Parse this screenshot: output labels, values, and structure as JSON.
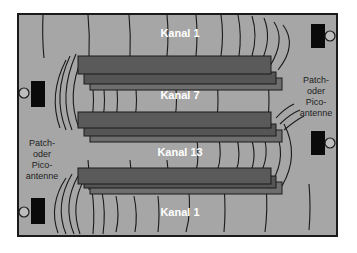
{
  "diagram": {
    "colors": {
      "room_fill": "#a6a6a6",
      "frame": "#1a1a1a",
      "shelf_top": "#5a5a5a",
      "shelf_mid": "#4d4d4d",
      "shelf_back": "#6e6e6e",
      "wave": "#1a1a1a",
      "antenna": "#0a0a0a",
      "channel_text": "#ffffff",
      "antenna_text": "#222222"
    },
    "channels": [
      {
        "label": "Kanal 1"
      },
      {
        "label": "Kanal 7"
      },
      {
        "label": "Kanal 13"
      },
      {
        "label": "Kanal 1"
      }
    ],
    "antenna_label_left": [
      "Patch-",
      "oder",
      "Pico-",
      "antenne"
    ],
    "antenna_label_right": [
      "Patch-",
      "oder",
      "Pico-",
      "antenne"
    ],
    "antennas": [
      {
        "position": "top-right"
      },
      {
        "position": "left-upper"
      },
      {
        "position": "right-lower"
      },
      {
        "position": "bottom-left"
      }
    ]
  }
}
